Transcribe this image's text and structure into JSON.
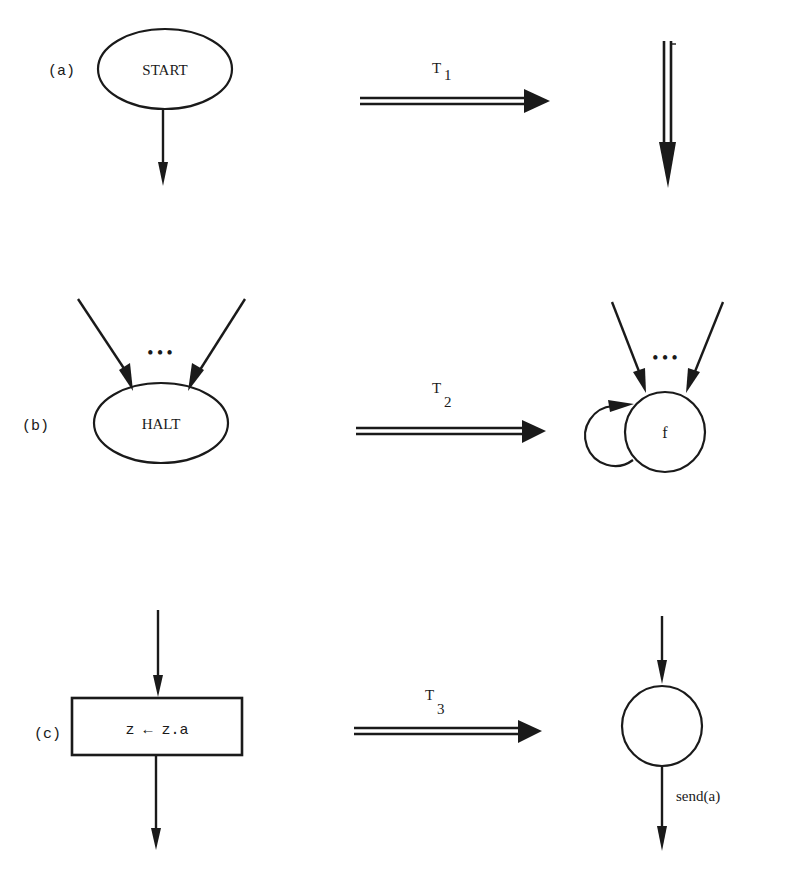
{
  "rows": [
    {
      "id": "a",
      "label": "(a)",
      "source_node": {
        "shape": "ellipse",
        "text": "START"
      },
      "transform": {
        "name": "T",
        "subscript": "1"
      },
      "target": {
        "shape": "double-line-arrow-down",
        "text": ""
      }
    },
    {
      "id": "b",
      "label": "(b)",
      "source_node": {
        "shape": "ellipse",
        "text": "HALT",
        "incoming_ellipsis": "• • •"
      },
      "transform": {
        "name": "T",
        "subscript": "2"
      },
      "target": {
        "shape": "circle-with-self-loop",
        "text": "f",
        "incoming_ellipsis": "• • •"
      }
    },
    {
      "id": "c",
      "label": "(c)",
      "source_node": {
        "shape": "rectangle",
        "text": "z ← z.a"
      },
      "transform": {
        "name": "T",
        "subscript": "3"
      },
      "target": {
        "shape": "circle",
        "text": "",
        "edge_label": "send(a)"
      }
    }
  ],
  "colors": {
    "ink": "#1a1a1a",
    "background": "#ffffff"
  }
}
